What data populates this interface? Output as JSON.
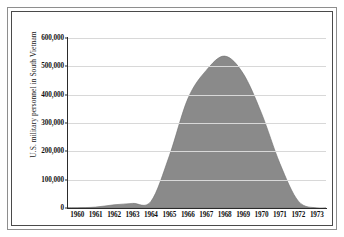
{
  "chart_data": {
    "type": "area",
    "title": "",
    "xlabel": "",
    "ylabel": "U.S. military personnel in South Vietnam",
    "xlim": [
      1959.5,
      1973.5
    ],
    "ylim": [
      0,
      600000
    ],
    "grid": true,
    "legend": null,
    "series_color": "#8a8a8a",
    "categories": [
      "1960",
      "1961",
      "1962",
      "1963",
      "1964",
      "1965",
      "1966",
      "1967",
      "1968",
      "1969",
      "1970",
      "1971",
      "1972",
      "1973"
    ],
    "x": [
      1960,
      1961,
      1962,
      1963,
      1964,
      1965,
      1966,
      1967,
      1968,
      1969,
      1970,
      1971,
      1972,
      1973
    ],
    "values": [
      900,
      3200,
      11300,
      16300,
      23300,
      184300,
      385300,
      485600,
      536100,
      475200,
      334600,
      156800,
      24200,
      50
    ],
    "ytick_labels": [
      "0",
      "100,000",
      "200,000",
      "300,000",
      "400,000",
      "500,000",
      "600,000"
    ],
    "ytick_values": [
      0,
      100000,
      200000,
      300000,
      400000,
      500000,
      600000
    ]
  }
}
